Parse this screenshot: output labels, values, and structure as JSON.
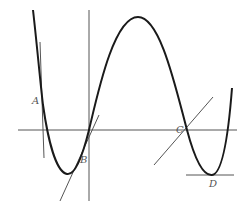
{
  "diagram": {
    "type": "function-graph-with-tangents",
    "colors": {
      "curve": "#1a1a1a",
      "axes": "#555555",
      "tangents": "#555555",
      "labels": "#555555"
    },
    "points": [
      {
        "id": "A",
        "label": "A",
        "x": 42,
        "y": 100
      },
      {
        "id": "B",
        "label": "B",
        "x": 89,
        "y": 130
      },
      {
        "id": "C",
        "label": "C",
        "x": 187,
        "y": 130
      },
      {
        "id": "D",
        "label": "D",
        "x": 212,
        "y": 175
      }
    ],
    "axes": {
      "x_axis": {
        "x1": 18,
        "y1": 130,
        "x2": 237,
        "y2": 130
      },
      "y_axis": {
        "x1": 89,
        "y1": 10,
        "x2": 89,
        "y2": 201
      }
    },
    "tangents": [
      {
        "at": "A",
        "x1": 40,
        "y1": 42,
        "x2": 44,
        "y2": 158
      },
      {
        "at": "B",
        "x1": 60,
        "y1": 201,
        "x2": 99,
        "y2": 115
      },
      {
        "at": "C",
        "x1": 154,
        "y1": 165,
        "x2": 213,
        "y2": 97
      },
      {
        "at": "D",
        "x1": 186,
        "y1": 175,
        "x2": 234,
        "y2": 175
      }
    ]
  }
}
